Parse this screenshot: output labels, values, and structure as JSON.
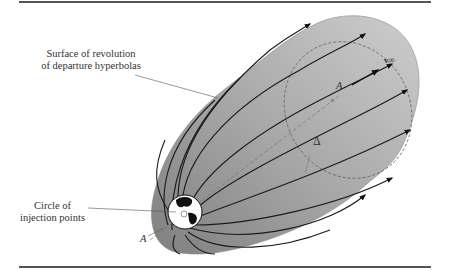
{
  "figure": {
    "labels": {
      "surface_line1": "Surface of revolution",
      "surface_line2": "of departure hyperbolas",
      "circle_line1": "Circle of",
      "circle_line2": "injection points",
      "point_a_top": "A",
      "point_a_bottom": "A",
      "delta": "Δ",
      "v_infinity": "v∞"
    },
    "colors": {
      "surface_dark": "#8c8c8c",
      "surface_light": "#c4c4c4",
      "lines": "#1a1a1a",
      "rule": "#555555"
    }
  }
}
